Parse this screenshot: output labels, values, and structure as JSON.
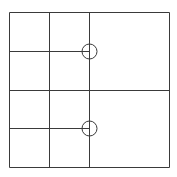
{
  "diagram": {
    "type": "grid-partition",
    "canvas": {
      "width": 177,
      "height": 177,
      "background": "#ffffff"
    },
    "stroke_color": "#3a3a3a",
    "stroke_width": 1,
    "outer_rect": {
      "x": 9,
      "y": 12,
      "width": 160,
      "height": 155
    },
    "lines": [
      {
        "id": "v1",
        "x1": 49,
        "y1": 12,
        "x2": 49,
        "y2": 167
      },
      {
        "id": "v2",
        "x1": 89,
        "y1": 12,
        "x2": 89,
        "y2": 167
      },
      {
        "id": "h-mid",
        "x1": 9,
        "y1": 90,
        "x2": 169,
        "y2": 90
      },
      {
        "id": "h-upper",
        "x1": 9,
        "y1": 51,
        "x2": 89,
        "y2": 51
      },
      {
        "id": "h-lower",
        "x1": 9,
        "y1": 128,
        "x2": 89,
        "y2": 128
      }
    ],
    "circles": [
      {
        "id": "node-upper",
        "cx": 89,
        "cy": 51,
        "r": 7.5
      },
      {
        "id": "node-lower",
        "cx": 89,
        "cy": 128,
        "r": 7.5
      }
    ]
  }
}
